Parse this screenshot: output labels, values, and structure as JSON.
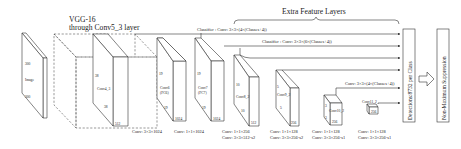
{
  "diagram": {
    "vgg_label": [
      "VGG-16",
      "through Conv5_3 layer"
    ],
    "extra_label": "Extra Feature Layers",
    "input": {
      "name": "Image",
      "dim_top": "300",
      "dim_bottom": "300",
      "depth": "3"
    },
    "conv4_3": {
      "name": "Conv4_3",
      "h": "38",
      "w": "38",
      "depth": "512"
    },
    "conv6": {
      "name": "Conv6",
      "sub": "(FC6)",
      "h": "19",
      "w": "19",
      "depth": "1024",
      "op": "Conv: 3×3×1024"
    },
    "conv7": {
      "name": "Conv7",
      "sub": "(FC7)",
      "h": "19",
      "w": "19",
      "depth": "1024",
      "op": "Conv: 1×1×1024"
    },
    "conv8_2": {
      "name": "Conv8_2",
      "h": "10",
      "w": "10",
      "depth": "512",
      "op1": "Conv: 1×1×256",
      "op2": "Conv: 3×3×512-s2"
    },
    "conv9_2": {
      "name": "Conv9_2",
      "h": "5",
      "w": "5",
      "depth": "256",
      "op1": "Conv: 1×1×128",
      "op2": "Conv: 3×3×256-s2"
    },
    "conv10_2": {
      "name": "Conv10_2",
      "h": "3",
      "w": "3",
      "depth": "256",
      "op1": "Conv: 1×1×128",
      "op2": "Conv: 3×3×256-s1"
    },
    "conv11_2": {
      "name": "Conv11_2",
      "depth": "256",
      "op1": "Conv: 1×1×128",
      "op2": "Conv: 3×3×256-s1"
    },
    "classifier1": "Classifier : Conv: 3×3×(4×(Classes+4))",
    "classifier2": "Classifier : Conv: 3×3×(6×(Classes+4))",
    "classifier3": "Conv: 3×3×(4×(Classes+4))",
    "detections": "Detections:8732 per Class",
    "nms": "Non-Maximum Suppression"
  }
}
